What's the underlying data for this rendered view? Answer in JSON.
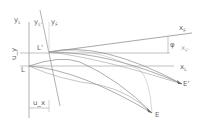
{
  "diagram": {
    "colors": {
      "line": "#9a9a9a",
      "curve": "#8a8a8a",
      "text": "#555555"
    },
    "labels": {
      "yL": "y",
      "yL_sub": "L",
      "yL2": "y",
      "yL2_sub": "L'",
      "yF": "y",
      "yF_sub": "F",
      "L_prime": "L'",
      "L": "L",
      "u_y": "u_y",
      "u_x": "u_x",
      "xF": "x",
      "xF_sub": "F",
      "phi": "φ",
      "xf2": "x",
      "xf2_sub": "F'",
      "xL": "x",
      "xL_sub": "L",
      "E_prime": "E'",
      "E": "E"
    }
  }
}
